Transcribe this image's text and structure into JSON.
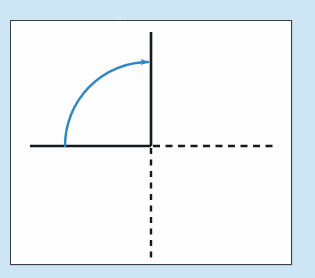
{
  "figure": {
    "kind": "geometry-diagram",
    "background_color": "#cde5f4",
    "panel_color": "#fdfdfd",
    "panel_border_color": "#3a3f45",
    "axis_color": "#16181b",
    "arc_color": "#2e86c8",
    "labels": {
      "panel": "",
      "angle": "",
      "x_axis": "",
      "y_axis": ""
    }
  },
  "chart_data": {
    "type": "scatter",
    "title": "",
    "xlabel": "",
    "ylabel": "",
    "grid": false,
    "legend": null,
    "origin": {
      "x": 151,
      "y": 146
    },
    "axes": [
      {
        "name": "x-axis-positive-solid",
        "style": "solid",
        "from": {
          "x": 30,
          "y": 146
        },
        "to": {
          "x": 151,
          "y": 146
        }
      },
      {
        "name": "x-axis-right-dashed",
        "style": "dashed",
        "from": {
          "x": 153,
          "y": 146
        },
        "to": {
          "x": 273,
          "y": 146
        }
      },
      {
        "name": "y-axis-positive-solid",
        "style": "solid",
        "from": {
          "x": 151,
          "y": 32
        },
        "to": {
          "x": 151,
          "y": 146
        }
      },
      {
        "name": "y-axis-down-dashed",
        "style": "dashed",
        "from": {
          "x": 151,
          "y": 148
        },
        "to": {
          "x": 151,
          "y": 262
        }
      }
    ],
    "arc": {
      "name": "rotation-arc",
      "color": "#2e86c8",
      "stroke_width": 2.4,
      "sweep_degrees": 90,
      "direction": "counterclockwise",
      "start": {
        "x": 65,
        "y": 146
      },
      "end": {
        "x": 148,
        "y": 62
      },
      "center": {
        "x": 65,
        "y": 62
      },
      "radius": 84,
      "arrowhead": {
        "at": "end",
        "points": "right",
        "tip": {
          "x": 151,
          "y": 61
        }
      }
    }
  }
}
